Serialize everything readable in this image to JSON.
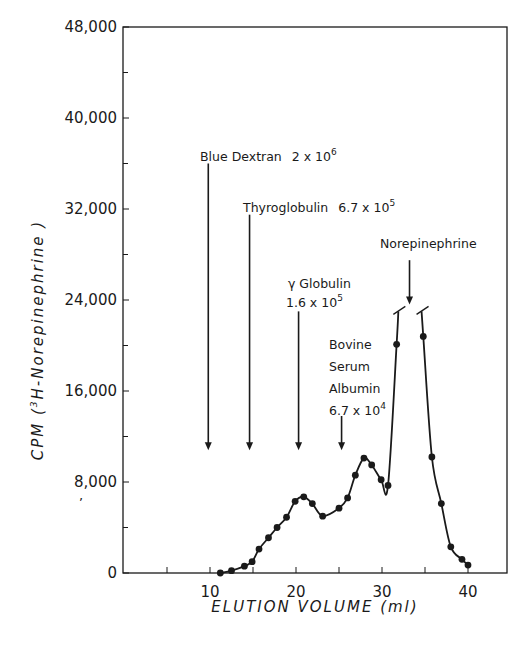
{
  "chart_data": {
    "type": "line",
    "title": "",
    "xlabel": "ELUTION VOLUME (ml)",
    "ylabel": "CPM (³H-Norepinephrine)",
    "xlim": [
      0,
      44.5
    ],
    "ylim": [
      0,
      48000
    ],
    "grid": false,
    "legend": null,
    "x_ticks": [
      10,
      20,
      30,
      40
    ],
    "x_minor_ticks": [
      5,
      15,
      25,
      35
    ],
    "y_ticks": [
      0,
      8000,
      16000,
      24000,
      32000,
      40000,
      48000
    ],
    "y_tick_labels": [
      "0",
      "8,000",
      "16,000",
      "24,000",
      "32,000",
      "40,000",
      "48,000"
    ],
    "y_minor_ticks": [
      4000,
      12000,
      20000,
      28000,
      36000,
      44000
    ],
    "x_tick_labels": [
      "10",
      "20",
      "30",
      "40"
    ],
    "series": [
      {
        "name": "3H-Norepinephrine",
        "marker": "filled-circle",
        "x": [
          11.2,
          12.5,
          14.0,
          14.9,
          15.7,
          16.8,
          17.8,
          18.9,
          19.9,
          20.9,
          21.9,
          23.1,
          25.0,
          26.0,
          26.9,
          27.9,
          28.8,
          29.9,
          30.7,
          31.7,
          34.8,
          35.8,
          36.9,
          38.0,
          39.3,
          40.0
        ],
        "y": [
          0,
          200,
          600,
          1000,
          2100,
          3100,
          4000,
          4900,
          6300,
          6700,
          6100,
          5000,
          5700,
          6600,
          8600,
          10100,
          9500,
          8200,
          7700,
          20100,
          20800,
          10200,
          6100,
          2300,
          1200,
          700
        ],
        "peak_off_scale": {
          "x_range": [
            32.0,
            34.6
          ],
          "broken_at": 23000
        }
      }
    ],
    "annotations": [
      {
        "label": "Blue Dextran",
        "mw": "2 x 10",
        "exp": "6",
        "x": 9.8,
        "arrow_top": 36000,
        "arrow_tip": 10800
      },
      {
        "label": "Thyroglobulin",
        "mw": "6.7 x 10",
        "exp": "5",
        "x": 14.6,
        "arrow_top": 31500,
        "arrow_tip": 10800
      },
      {
        "label": "γ Globulin",
        "mw": "1.6 x 10",
        "exp": "5",
        "x": 20.3,
        "arrow_top": 23000,
        "arrow_tip": 10800
      },
      {
        "label": "Bovine Serum Albumin",
        "mw": "6.7 x 10",
        "exp": "4",
        "x": 25.3,
        "arrow_top": 13800,
        "arrow_tip": 10800
      },
      {
        "label": "Norepinephrine",
        "mw": "",
        "exp": "",
        "x": 33.2,
        "arrow_top": 27500,
        "arrow_tip": 23600
      }
    ]
  },
  "labels": {
    "blue_dextran": "Blue Dextran",
    "blue_dextran_mw": "2 x 10",
    "blue_dextran_exp": "6",
    "thyroglobulin": "Thyroglobulin",
    "thyroglobulin_mw": "6.7 x 10",
    "thyroglobulin_exp": "5",
    "gamma_globulin": "γ Globulin",
    "gamma_globulin_mw": "1.6 x 10",
    "gamma_globulin_exp": "5",
    "bsa_line1": "Bovine",
    "bsa_line2": "Serum",
    "bsa_line3": "Albumin",
    "bsa_mw": "6.7 x 10",
    "bsa_exp": "4",
    "norepinephrine": "Norepinephrine",
    "xlabel": "ELUTION VOLUME (ml)",
    "ylabel_prefix": "CPM  (",
    "ylabel_sup": "3",
    "ylabel_suffix": "H-Norepinephrine )"
  }
}
